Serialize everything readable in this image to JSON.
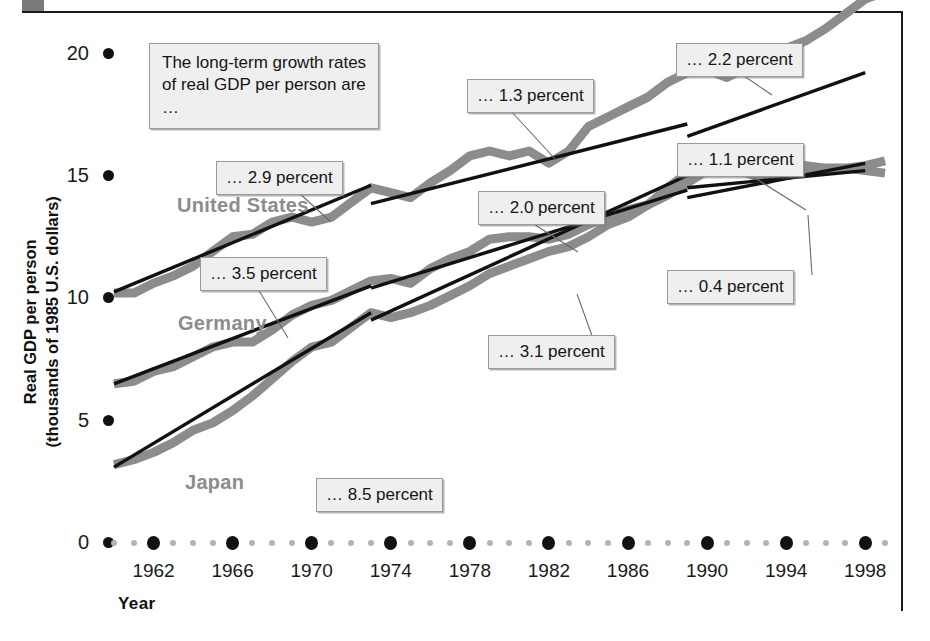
{
  "figure": {
    "intro_note": "The long-term growth rates of real GDP per person are …"
  },
  "axes": {
    "y_title_line1": "Real GDP per person",
    "y_title_line2": "(thousands of 1985 U.S. dollars)",
    "x_title": "Year",
    "y_ticks": [
      "20",
      "15",
      "10",
      "5",
      "0"
    ],
    "x_ticks": [
      "1962",
      "1966",
      "1970",
      "1974",
      "1978",
      "1982",
      "1986",
      "1990",
      "1994",
      "1998"
    ]
  },
  "series_labels": {
    "united_states": "United States",
    "germany": "Germany",
    "japan": "Japan"
  },
  "callouts": {
    "us_early": "… 2.9 percent",
    "us_mid": "… 1.3 percent",
    "us_late": "… 2.2 percent",
    "germany_early": "… 3.5 percent",
    "germany_mid": "… 2.0 percent",
    "germany_late": "… 1.1 percent",
    "japan_early": "… 8.5 percent",
    "japan_mid": "… 3.1 percent",
    "japan_late": "… 0.4 percent"
  },
  "colors": {
    "data_line": "#8c8c8c",
    "trend_line": "#111111",
    "callout_fill": "#efefef",
    "callout_border": "#9a9a9a",
    "axis_dot": "#111111",
    "minor_dot": "#b3b3b3"
  },
  "chart_data": {
    "type": "line",
    "title": "",
    "xlabel": "Year",
    "ylabel": "Real GDP per person (thousands of 1985 U.S. dollars)",
    "xlim": [
      1960,
      1999
    ],
    "ylim": [
      0,
      20
    ],
    "grid": false,
    "legend": "inline-series-labels",
    "x": [
      1960,
      1961,
      1962,
      1963,
      1964,
      1965,
      1966,
      1967,
      1968,
      1969,
      1970,
      1971,
      1972,
      1973,
      1974,
      1975,
      1976,
      1977,
      1978,
      1979,
      1980,
      1981,
      1982,
      1983,
      1984,
      1985,
      1986,
      1987,
      1988,
      1989,
      1990,
      1991,
      1992,
      1993,
      1994,
      1995,
      1996,
      1997,
      1998,
      1999
    ],
    "series": [
      {
        "name": "United States",
        "values": [
          10.2,
          10.2,
          10.6,
          10.9,
          11.3,
          11.9,
          12.5,
          12.6,
          13.1,
          13.3,
          13.1,
          13.3,
          13.9,
          14.5,
          14.3,
          14.1,
          14.7,
          15.2,
          15.8,
          16.0,
          15.8,
          16.0,
          15.5,
          16.0,
          17.0,
          17.4,
          17.8,
          18.2,
          18.8,
          19.2,
          19.3,
          19.0,
          19.4,
          19.7,
          20.2,
          20.5,
          21.0,
          21.6,
          22.2,
          22.5
        ],
        "growth_rate_segments": [
          {
            "label": "… 2.9 percent",
            "period": "1960–1973",
            "value": 2.9
          },
          {
            "label": "… 1.3 percent",
            "period": "1973–1989",
            "value": 1.3
          },
          {
            "label": "… 2.2 percent",
            "period": "1989–1998",
            "value": 2.2
          }
        ]
      },
      {
        "name": "Germany",
        "values": [
          6.5,
          6.6,
          7.0,
          7.2,
          7.6,
          8.0,
          8.2,
          8.2,
          8.7,
          9.3,
          9.7,
          9.9,
          10.3,
          10.7,
          10.8,
          10.6,
          11.2,
          11.6,
          11.9,
          12.4,
          12.5,
          12.5,
          12.4,
          12.6,
          13.0,
          13.3,
          13.6,
          13.8,
          14.2,
          14.7,
          15.2,
          15.2,
          15.1,
          14.8,
          15.1,
          15.2,
          15.2,
          15.3,
          15.4,
          15.6
        ],
        "growth_rate_segments": [
          {
            "label": "… 3.5 percent",
            "period": "1960–1973",
            "value": 3.5
          },
          {
            "label": "… 2.0 percent",
            "period": "1973–1989",
            "value": 2.0
          },
          {
            "label": "… 1.1 percent",
            "period": "1989–1998",
            "value": 1.1
          }
        ]
      },
      {
        "name": "Japan",
        "values": [
          3.2,
          3.4,
          3.7,
          4.1,
          4.6,
          4.9,
          5.4,
          6.0,
          6.7,
          7.4,
          8.0,
          8.2,
          8.8,
          9.4,
          9.2,
          9.4,
          9.7,
          10.1,
          10.5,
          11.0,
          11.3,
          11.6,
          11.9,
          12.1,
          12.5,
          13.0,
          13.3,
          13.8,
          14.5,
          15.1,
          15.7,
          15.9,
          15.8,
          15.6,
          15.5,
          15.4,
          15.3,
          15.3,
          15.2,
          15.1
        ],
        "growth_rate_segments": [
          {
            "label": "… 8.5 percent",
            "period": "1960–1973",
            "value": 8.5
          },
          {
            "label": "… 3.1 percent",
            "period": "1973–1989",
            "value": 3.1
          },
          {
            "label": "… 0.4 percent",
            "period": "1989–1998",
            "value": 0.4
          }
        ]
      }
    ],
    "trend_lines": [
      {
        "series": "United States",
        "segments": [
          [
            1960,
            10.25,
            1973,
            14.6
          ],
          [
            1973,
            13.85,
            1989,
            17.1
          ],
          [
            1989,
            16.6,
            1998,
            19.2
          ]
        ]
      },
      {
        "series": "Germany",
        "segments": [
          [
            1960,
            6.5,
            1973,
            10.5
          ],
          [
            1973,
            10.4,
            1989,
            14.4
          ],
          [
            1989,
            14.1,
            1998,
            15.5
          ]
        ]
      },
      {
        "series": "Japan",
        "segments": [
          [
            1960,
            3.1,
            1973,
            9.4
          ],
          [
            1973,
            9.1,
            1989,
            15.0
          ],
          [
            1989,
            14.5,
            1998,
            15.2
          ]
        ]
      }
    ]
  }
}
